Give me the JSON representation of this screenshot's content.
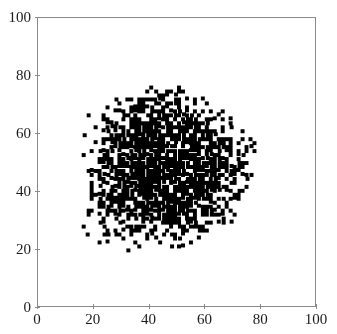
{
  "chart_data": {
    "type": "scatter",
    "title": "",
    "subtitle": "",
    "xlabel": "",
    "ylabel": "",
    "xlim": [
      0,
      100
    ],
    "ylim": [
      0,
      100
    ],
    "grid": false,
    "legend": null,
    "legend_position": "none",
    "marker": {
      "shape": "square",
      "color": "#000000",
      "size_px": 4,
      "count_estimate": 1800
    },
    "xticks": [
      {
        "value": 0,
        "label": "0"
      },
      {
        "value": 20,
        "label": "20"
      },
      {
        "value": 40,
        "label": "40"
      },
      {
        "value": 60,
        "label": "60"
      },
      {
        "value": 80,
        "label": "80"
      },
      {
        "value": 100,
        "label": "100"
      }
    ],
    "yticks": [
      {
        "value": 0,
        "label": "0"
      },
      {
        "value": 20,
        "label": "20"
      },
      {
        "value": 40,
        "label": "40"
      },
      {
        "value": 60,
        "label": "60"
      },
      {
        "value": 80,
        "label": "80"
      },
      {
        "value": 100,
        "label": "100"
      }
    ],
    "cluster": {
      "description": "single dense near-saturated blob of black square markers with ragged speckled edges",
      "center_x": 46,
      "center_y": 48,
      "radius_x": 29,
      "radius_y": 26,
      "x_range": [
        17,
        76
      ],
      "y_range": [
        21,
        74
      ],
      "core_fill_fraction": 0.93,
      "edge_fill_fraction": 0.12,
      "random_seed": 20240517
    },
    "axis_color": "#8a8a8a",
    "tick_color": "#8a8a8a",
    "label_color": "#1a1a1a",
    "background_color": "#ffffff"
  }
}
